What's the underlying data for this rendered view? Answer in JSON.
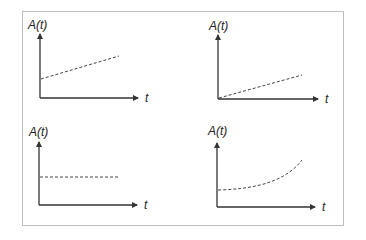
{
  "diagram": {
    "panels": [
      {
        "id": "linear-offset",
        "y_label": "A(t)",
        "x_label": "t",
        "curve": "linear increasing from positive intercept"
      },
      {
        "id": "linear-origin",
        "y_label": "A(t)",
        "x_label": "t",
        "curve": "linear increasing from origin"
      },
      {
        "id": "constant",
        "y_label": "A(t)",
        "x_label": "t",
        "curve": "constant horizontal"
      },
      {
        "id": "exponential",
        "y_label": "A(t)",
        "x_label": "t",
        "curve": "exponential growth"
      }
    ]
  },
  "colors": {
    "axis": "#333333",
    "curve": "#444444",
    "frame": "#bdbdbd"
  }
}
